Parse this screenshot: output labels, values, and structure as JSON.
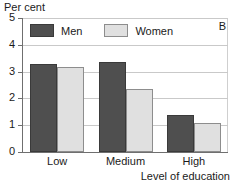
{
  "panel": {
    "label": "B"
  },
  "legend": {
    "position": "top-left-inside",
    "entries": [
      {
        "name": "men",
        "label": "Men",
        "color": "#4f4f4f"
      },
      {
        "name": "women",
        "label": "Women",
        "color": "#e0e0e0"
      }
    ]
  },
  "axes": {
    "ylabel": "Per cent",
    "xlabel": "Level of education",
    "yticks": [
      "0",
      "1",
      "2",
      "3",
      "4",
      "5"
    ]
  },
  "chart_data": {
    "type": "bar",
    "title": "",
    "subtitle": "",
    "panel_label": "B",
    "categories": [
      "Low",
      "Medium",
      "High"
    ],
    "series": [
      {
        "name": "Men",
        "color": "#4f4f4f",
        "values": [
          3.3,
          3.35,
          1.37
        ]
      },
      {
        "name": "Women",
        "color": "#e0e0e0",
        "values": [
          3.18,
          2.35,
          1.1
        ]
      }
    ],
    "xlabel": "Level of education",
    "ylabel": "Per cent",
    "ylim": [
      0,
      5
    ],
    "yticks": [
      0,
      1,
      2,
      3,
      4,
      5
    ],
    "grid": true,
    "grid_axis": "y",
    "legend": true,
    "legend_position": "upper left inside"
  }
}
